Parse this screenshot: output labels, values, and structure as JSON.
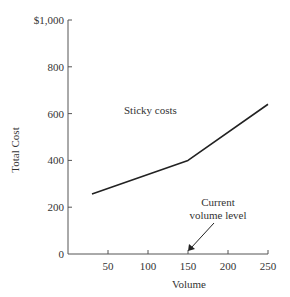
{
  "chart_data": {
    "type": "line",
    "title": "",
    "xlabel": "Volume",
    "ylabel": "Total Cost",
    "xlim": [
      0,
      250
    ],
    "ylim": [
      0,
      1000
    ],
    "x_ticks": [
      50,
      100,
      150,
      200,
      250
    ],
    "x_tick_labels": [
      "50",
      "100",
      "150",
      "200",
      "250"
    ],
    "y_ticks": [
      0,
      200,
      400,
      600,
      800,
      1000
    ],
    "y_tick_labels": [
      "0",
      "200",
      "400",
      "600",
      "800",
      "$1,000"
    ],
    "grid": false,
    "legend": null,
    "series": [
      {
        "name": "Total cost (sticky costs)",
        "x": [
          30,
          150,
          250
        ],
        "y": [
          256,
          400,
          640
        ]
      }
    ],
    "annotations": [
      {
        "text": "Sticky costs",
        "x": 125,
        "y": 590
      },
      {
        "text": "Current volume level",
        "lines": [
          "Current",
          "volume level"
        ],
        "arrow_to": {
          "x": 150,
          "y": 0
        }
      }
    ]
  },
  "labels": {
    "y_axis_title": "Total Cost",
    "x_axis_title": "Volume",
    "sticky_costs": "Sticky costs",
    "current_line1": "Current",
    "current_line2": "volume level"
  },
  "colors": {
    "axis": "#555555",
    "line": "#222222",
    "text": "#333333"
  }
}
